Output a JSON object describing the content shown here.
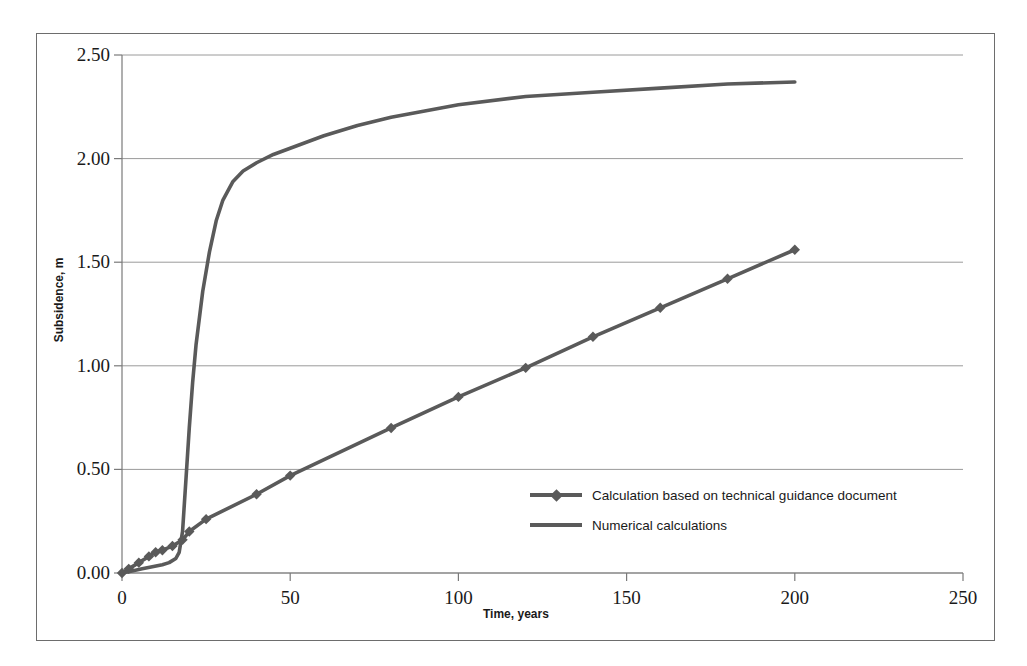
{
  "chart_data": {
    "type": "line",
    "title": "",
    "xlabel": "Time, years",
    "ylabel": "Subsidence, m",
    "xlim": [
      0,
      250
    ],
    "ylim": [
      0.0,
      2.5
    ],
    "xticks": [
      0,
      50,
      100,
      150,
      200,
      250
    ],
    "xtick_labels": [
      "0",
      "50",
      "100",
      "150",
      "200",
      "250"
    ],
    "yticks": [
      0.0,
      0.5,
      1.0,
      1.5,
      2.0,
      2.5
    ],
    "ytick_labels": [
      "0.00",
      "0.50",
      "1.00",
      "1.50",
      "2.00",
      "2.50"
    ],
    "grid": "horizontal",
    "legend_position": "inside-center-right",
    "series": [
      {
        "name": "Calculation based on technical guidance document",
        "style": "line-with-diamond-markers",
        "color": "#5a5a5a",
        "marker": "diamond",
        "x": [
          0,
          2,
          5,
          8,
          10,
          12,
          15,
          18,
          20,
          25,
          40,
          50,
          80,
          100,
          120,
          140,
          160,
          180,
          200
        ],
        "y": [
          0.0,
          0.02,
          0.05,
          0.08,
          0.1,
          0.11,
          0.13,
          0.16,
          0.2,
          0.26,
          0.38,
          0.47,
          0.7,
          0.85,
          0.99,
          1.14,
          1.28,
          1.42,
          1.56
        ]
      },
      {
        "name": "Numerical calculations",
        "style": "line",
        "color": "#5a5a5a",
        "marker": "none",
        "x": [
          0,
          3,
          6,
          9,
          12,
          14,
          16,
          17,
          18,
          19,
          20,
          21,
          22,
          24,
          26,
          28,
          30,
          33,
          36,
          40,
          45,
          50,
          55,
          60,
          70,
          80,
          90,
          100,
          120,
          140,
          160,
          180,
          200
        ],
        "y": [
          0.0,
          0.01,
          0.02,
          0.03,
          0.04,
          0.05,
          0.07,
          0.1,
          0.2,
          0.45,
          0.7,
          0.92,
          1.1,
          1.36,
          1.55,
          1.7,
          1.8,
          1.89,
          1.94,
          1.98,
          2.02,
          2.05,
          2.08,
          2.11,
          2.16,
          2.2,
          2.23,
          2.26,
          2.3,
          2.32,
          2.34,
          2.36,
          2.37
        ]
      }
    ]
  },
  "legend": {
    "entries": [
      {
        "label": "Calculation based on technical guidance document",
        "marker": "diamond"
      },
      {
        "label": "Numerical calculations",
        "marker": "none"
      }
    ]
  },
  "colors": {
    "series": "#5a5a5a",
    "grid": "#9a9a9a",
    "axis": "#7a7a7a",
    "frame": "#6d6d6d",
    "text": "#1a1a1a",
    "background": "#ffffff"
  }
}
